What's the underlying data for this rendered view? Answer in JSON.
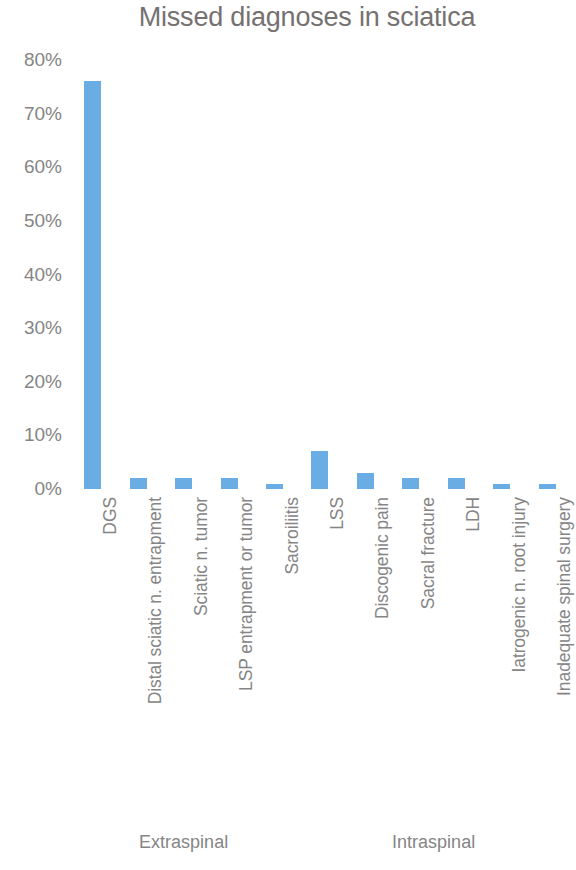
{
  "chart_data": {
    "type": "bar",
    "title": "Missed diagnoses in sciatica",
    "xlabel": "",
    "ylabel": "",
    "ylim": [
      0,
      80
    ],
    "yticks": [
      "0%",
      "10%",
      "20%",
      "30%",
      "40%",
      "50%",
      "60%",
      "70%",
      "80%"
    ],
    "ytick_values": [
      0,
      10,
      20,
      30,
      40,
      50,
      60,
      70,
      80
    ],
    "grid": false,
    "legend": "none",
    "bar_color": "#6aade4",
    "title_color": "#767171",
    "label_color": "#858585",
    "categories": [
      "DGS",
      "Distal sciatic n. entrapment",
      "Sciatic n. tumor",
      "LSP entrapment or tumor",
      "Sacroiliitis",
      "LSS",
      "Discogenic pain",
      "Sacral fracture",
      "LDH",
      "Iatrogenic n. root injury",
      "Inadequate spinal surgery"
    ],
    "values": [
      76,
      2,
      2,
      2,
      1,
      7,
      3,
      2,
      2,
      1,
      1
    ],
    "groups": [
      {
        "label": "Extraspinal",
        "categories": [
          "DGS",
          "Distal sciatic n. entrapment",
          "Sciatic n. tumor",
          "LSP entrapment or tumor",
          "Sacroiliitis"
        ]
      },
      {
        "label": "Intraspinal",
        "categories": [
          "LSS",
          "Discogenic pain",
          "Sacral fracture",
          "LDH",
          "Iatrogenic n. root injury",
          "Inadequate spinal surgery"
        ]
      }
    ]
  }
}
